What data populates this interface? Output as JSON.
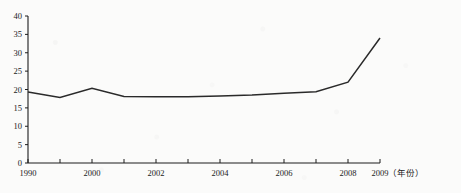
{
  "chart_data": {
    "type": "line",
    "title": "",
    "xlabel": "（年份）",
    "ylabel": "",
    "xlim": [
      1990,
      2009
    ],
    "ylim": [
      0,
      40
    ],
    "grid": false,
    "legend": "none",
    "x": [
      1990,
      1999,
      2000,
      2001,
      2002,
      2003,
      2004,
      2005,
      2006,
      2007,
      2008,
      2009
    ],
    "values": [
      19.3,
      17.8,
      20.3,
      18.1,
      18.0,
      18.0,
      18.2,
      18.5,
      19.0,
      19.4,
      22.0,
      34.0
    ],
    "series": [
      {
        "name": "series-1",
        "values": [
          19.3,
          17.8,
          20.3,
          18.1,
          18.0,
          18.0,
          18.2,
          18.5,
          19.0,
          19.4,
          22.0,
          34.0
        ]
      }
    ],
    "x_tick_labels": [
      "1990",
      "",
      "2000",
      "",
      "2002",
      "",
      "2004",
      "",
      "2006",
      "",
      "2008",
      "2009"
    ],
    "x_tick_values": [
      1990,
      1999,
      2000,
      2001,
      2002,
      2003,
      2004,
      2005,
      2006,
      2007,
      2008,
      2009
    ],
    "y_tick_labels": [
      "0",
      "5",
      "10",
      "15",
      "20",
      "25",
      "30",
      "35",
      "40"
    ],
    "y_tick_values": [
      0,
      5,
      10,
      15,
      20,
      25,
      30,
      35,
      40
    ],
    "line_color": "#2a2a2a",
    "axis_color": "#1d1d1d",
    "background_color": "#fbfbfa"
  }
}
